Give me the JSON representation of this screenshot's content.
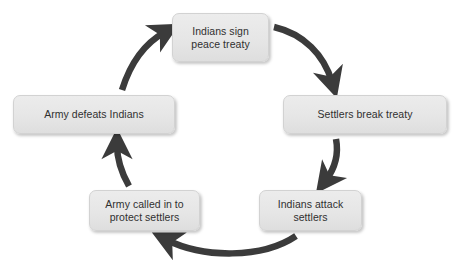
{
  "diagram": {
    "type": "cycle",
    "title": "",
    "background_color": "#ffffff",
    "node_fill_color": "#e8e8e8",
    "node_border_color": "#d2d2d2",
    "node_text_color": "#303030",
    "arrow_color": "#3b3b3b",
    "nodes": [
      {
        "id": "indians-sign-peace-treaty",
        "position": "top",
        "lines": [
          "Indians sign",
          "peace treaty"
        ],
        "text": "Indians sign peace treaty"
      },
      {
        "id": "settlers-break-treaty",
        "position": "right",
        "lines": [
          "Settlers break treaty"
        ],
        "text": "Settlers break treaty"
      },
      {
        "id": "indians-attack-settlers",
        "position": "bottom-right",
        "lines": [
          "Indians attack",
          "settlers"
        ],
        "text": "Indians attack settlers"
      },
      {
        "id": "army-called-in-to-protect-settlers",
        "position": "bottom-left",
        "lines": [
          "Army called in to",
          "protect settlers"
        ],
        "text": "Army called in to protect settlers"
      },
      {
        "id": "army-defeats-indians",
        "position": "left",
        "lines": [
          "Army defeats Indians"
        ],
        "text": "Army defeats Indians"
      }
    ],
    "edges": [
      {
        "from": "indians-sign-peace-treaty",
        "to": "settlers-break-treaty",
        "label": ""
      },
      {
        "from": "settlers-break-treaty",
        "to": "indians-attack-settlers",
        "label": ""
      },
      {
        "from": "indians-attack-settlers",
        "to": "army-called-in-to-protect-settlers",
        "label": ""
      },
      {
        "from": "army-called-in-to-protect-settlers",
        "to": "army-defeats-indians",
        "label": ""
      },
      {
        "from": "army-defeats-indians",
        "to": "indians-sign-peace-treaty",
        "label": ""
      }
    ]
  }
}
